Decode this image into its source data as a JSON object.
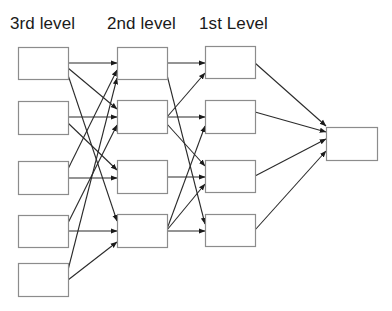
{
  "labels": {
    "level3": "3rd level",
    "level2": "2nd level",
    "level1": "1st Level"
  },
  "colors": {
    "box_stroke": "#8c8c8c",
    "edge": "#2a2a2a",
    "text": "#1a1a1a",
    "background": "#ffffff"
  },
  "nodes": {
    "level3": [
      {
        "id": "L3-1",
        "x": 18,
        "y": 47,
        "w": 50,
        "h": 32
      },
      {
        "id": "L3-2",
        "x": 18,
        "y": 101,
        "w": 50,
        "h": 33
      },
      {
        "id": "L3-3",
        "x": 18,
        "y": 161,
        "w": 50,
        "h": 33
      },
      {
        "id": "L3-4",
        "x": 18,
        "y": 215,
        "w": 50,
        "h": 32
      },
      {
        "id": "L3-5",
        "x": 18,
        "y": 263,
        "w": 50,
        "h": 33
      }
    ],
    "level2": [
      {
        "id": "L2-1",
        "x": 117,
        "y": 47,
        "w": 50,
        "h": 32
      },
      {
        "id": "L2-2",
        "x": 117,
        "y": 100,
        "w": 50,
        "h": 33
      },
      {
        "id": "L2-3",
        "x": 117,
        "y": 160,
        "w": 50,
        "h": 33
      },
      {
        "id": "L2-4",
        "x": 117,
        "y": 214,
        "w": 50,
        "h": 33
      }
    ],
    "level1": [
      {
        "id": "L1-1",
        "x": 205,
        "y": 46,
        "w": 50,
        "h": 32
      },
      {
        "id": "L1-2",
        "x": 205,
        "y": 100,
        "w": 50,
        "h": 33
      },
      {
        "id": "L1-3",
        "x": 205,
        "y": 160,
        "w": 50,
        "h": 32
      },
      {
        "id": "L1-4",
        "x": 205,
        "y": 214,
        "w": 50,
        "h": 32
      }
    ],
    "output": [
      {
        "id": "OUT",
        "x": 326,
        "y": 127,
        "w": 51,
        "h": 33
      }
    ]
  },
  "edges": [
    {
      "from": "L3-1",
      "to": "L2-1",
      "x1": 68,
      "y1": 63,
      "x2": 117,
      "y2": 63
    },
    {
      "from": "L3-1",
      "to": "L2-2",
      "x1": 68,
      "y1": 68,
      "x2": 117,
      "y2": 109
    },
    {
      "from": "L3-1",
      "to": "L2-4",
      "x1": 68,
      "y1": 75,
      "x2": 117,
      "y2": 221
    },
    {
      "from": "L3-2",
      "to": "L2-2",
      "x1": 68,
      "y1": 117,
      "x2": 117,
      "y2": 117
    },
    {
      "from": "L3-2",
      "to": "L2-3",
      "x1": 68,
      "y1": 123,
      "x2": 117,
      "y2": 170
    },
    {
      "from": "L3-3",
      "to": "L2-1",
      "x1": 68,
      "y1": 169,
      "x2": 117,
      "y2": 70
    },
    {
      "from": "L3-3",
      "to": "L2-3",
      "x1": 68,
      "y1": 178,
      "x2": 117,
      "y2": 178
    },
    {
      "from": "L3-4",
      "to": "L2-2",
      "x1": 68,
      "y1": 223,
      "x2": 117,
      "y2": 125
    },
    {
      "from": "L3-4",
      "to": "L2-4",
      "x1": 68,
      "y1": 231,
      "x2": 117,
      "y2": 231
    },
    {
      "from": "L3-5",
      "to": "L2-1",
      "x1": 68,
      "y1": 270,
      "x2": 117,
      "y2": 78
    },
    {
      "from": "L3-5",
      "to": "L2-4",
      "x1": 68,
      "y1": 280,
      "x2": 117,
      "y2": 242
    },
    {
      "from": "L2-1",
      "to": "L1-1",
      "x1": 167,
      "y1": 63,
      "x2": 205,
      "y2": 63
    },
    {
      "from": "L2-1",
      "to": "L1-4",
      "x1": 167,
      "y1": 75,
      "x2": 205,
      "y2": 224
    },
    {
      "from": "L2-2",
      "to": "L1-1",
      "x1": 167,
      "y1": 117,
      "x2": 205,
      "y2": 73
    },
    {
      "from": "L2-2",
      "to": "L1-2",
      "x1": 167,
      "y1": 117,
      "x2": 205,
      "y2": 117
    },
    {
      "from": "L2-2",
      "to": "L1-3",
      "x1": 167,
      "y1": 124,
      "x2": 205,
      "y2": 166
    },
    {
      "from": "L2-3",
      "to": "L1-3",
      "x1": 167,
      "y1": 177,
      "x2": 205,
      "y2": 177
    },
    {
      "from": "L2-4",
      "to": "L1-2",
      "x1": 167,
      "y1": 229,
      "x2": 205,
      "y2": 126
    },
    {
      "from": "L2-4",
      "to": "L1-3",
      "x1": 167,
      "y1": 230,
      "x2": 205,
      "y2": 184
    },
    {
      "from": "L2-4",
      "to": "L1-4",
      "x1": 167,
      "y1": 231,
      "x2": 205,
      "y2": 231
    },
    {
      "from": "L1-1",
      "to": "OUT",
      "x1": 255,
      "y1": 63,
      "x2": 326,
      "y2": 126
    },
    {
      "from": "L1-2",
      "to": "OUT",
      "x1": 255,
      "y1": 112,
      "x2": 326,
      "y2": 132
    },
    {
      "from": "L1-3",
      "to": "OUT",
      "x1": 255,
      "y1": 176,
      "x2": 326,
      "y2": 139
    },
    {
      "from": "L1-4",
      "to": "OUT",
      "x1": 255,
      "y1": 230,
      "x2": 326,
      "y2": 151
    }
  ]
}
